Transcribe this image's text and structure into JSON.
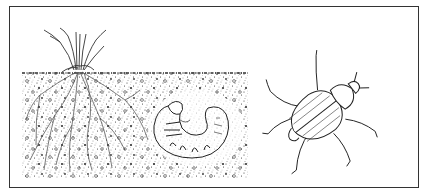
{
  "illustration": {
    "subject": "June beetle life cycle: grass roots in soil, larva (white grub) in soil cavity, adult beetle",
    "panels": [
      {
        "name": "grass-tuft",
        "description": "plant stems above soil surface"
      },
      {
        "name": "soil-cross-section",
        "description": "stippled soil with branching roots"
      },
      {
        "name": "grub-larva",
        "description": "C-shaped curled grub in oval soil cavity"
      },
      {
        "name": "adult-beetle",
        "description": "ridged-wing beetle seen from above, diagonal"
      }
    ],
    "colors": {
      "ink": "#222222",
      "background": "#ffffff",
      "frame": "#333333"
    }
  }
}
